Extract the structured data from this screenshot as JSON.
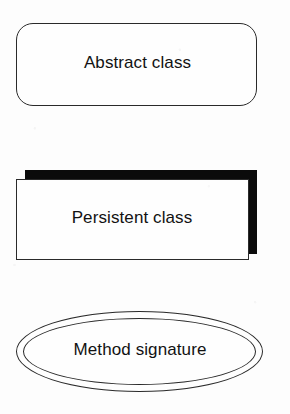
{
  "diagram": {
    "type": "uml-notation-legend",
    "background_color": "#fdfdfd",
    "stroke_color": "#2a2a2a",
    "fill_color": "#fefefe",
    "shadow_color": "#0b0b0b",
    "text_color": "#121212",
    "shapes": [
      {
        "id": "abstract-class",
        "label": "Abstract class",
        "glyph": "rounded-rectangle",
        "stroke": "#2a2a2a",
        "fill": "#fefefe"
      },
      {
        "id": "persistent-class",
        "label": "Persistent class",
        "glyph": "rectangle-with-drop-shadow",
        "stroke": "#2a2a2a",
        "fill": "#fefefe",
        "shadow": "#0b0b0b"
      },
      {
        "id": "method-signature",
        "label": "Method signature",
        "glyph": "double-ellipse",
        "stroke": "#2a2a2a",
        "fill": "#fefefe"
      }
    ]
  }
}
